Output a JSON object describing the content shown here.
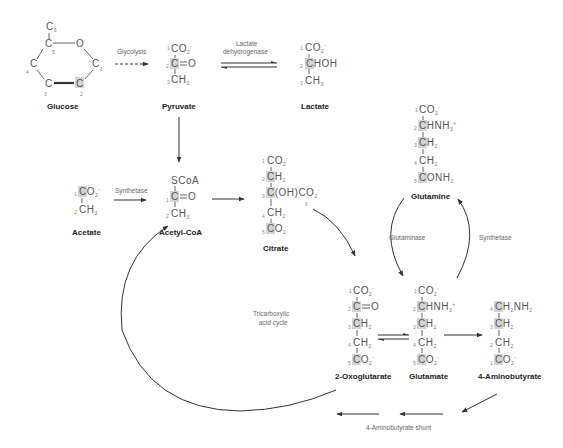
{
  "molecules": {
    "glucose": {
      "name": "Glucose",
      "atoms": [
        "C",
        "C",
        "O",
        "C",
        "C",
        "C",
        "C"
      ],
      "numbers": [
        "6",
        "5",
        "4",
        "1",
        "3",
        "2"
      ]
    },
    "pyruvate": {
      "name": "Pyruvate",
      "lines": [
        "CO2-",
        "C=O",
        "CH3"
      ],
      "numbers": [
        "1",
        "2",
        "3"
      ],
      "labeled_carbon": "2"
    },
    "lactate": {
      "name": "Lactate",
      "lines": [
        "CO2-",
        "CHOH",
        "CH3"
      ],
      "numbers": [
        "1",
        "2",
        "3"
      ],
      "labeled_carbon": "2"
    },
    "acetate": {
      "name": "Acetate",
      "lines": [
        "CO2-",
        "CH3"
      ],
      "numbers": [
        "1",
        "2"
      ],
      "labeled_carbon": "1"
    },
    "acetyl_coa": {
      "name": "Acetyl-CoA",
      "lines": [
        "SCoA",
        "C=O",
        "CH3"
      ],
      "numbers": [
        "1",
        "2"
      ],
      "labeled_carbon": "1"
    },
    "citrate": {
      "name": "Citrate",
      "lines": [
        "CO2-",
        "CH2",
        "C(OH)CO2-",
        "CH2",
        "CO2-"
      ],
      "numbers": [
        "1",
        "2",
        "3",
        "4",
        "5",
        "6"
      ],
      "labeled_carbons": [
        "2",
        "3",
        "5"
      ]
    },
    "oxoglutarate": {
      "name": "2-Oxoglutarate",
      "lines": [
        "CO2-",
        "C=O",
        "CH2",
        "CH2",
        "CO2-"
      ],
      "numbers": [
        "1",
        "2",
        "3",
        "4",
        "5"
      ],
      "labeled_carbons": [
        "2",
        "3",
        "5"
      ]
    },
    "glutamate": {
      "name": "Glutamate",
      "lines": [
        "CO2-",
        "CHNH3+",
        "CH2",
        "CH2",
        "CO2-"
      ],
      "numbers": [
        "1",
        "2",
        "3",
        "4",
        "5"
      ],
      "labeled_carbons": [
        "2",
        "3",
        "5"
      ]
    },
    "glutamine": {
      "name": "Glutamine",
      "lines": [
        "CO2-",
        "CHNH3+",
        "CH2",
        "CH2",
        "CONH2"
      ],
      "numbers": [
        "1",
        "2",
        "3",
        "4",
        "5"
      ],
      "labeled_carbons": [
        "2",
        "3",
        "5"
      ]
    },
    "aminobutyrate": {
      "name": "4-Aminobutyrate",
      "lines": [
        "CH2NH2",
        "CH2",
        "CH2",
        "CO2-"
      ],
      "numbers": [
        "4",
        "3",
        "2",
        "1"
      ],
      "labeled_carbons": [
        "4",
        "3",
        "1"
      ]
    }
  },
  "enzymes": {
    "glycolysis": "Glycolysis",
    "ldh_line1": "Lactate",
    "ldh_line2": "dehydrogenase",
    "acetate_synthetase": "Synthetase",
    "glutaminase": "Glutaminase",
    "glutamine_synthetase": "Synthetase",
    "tca_line1": "Tricarboxylic",
    "tca_line2": "acid cycle",
    "shunt": "4-Aminobutyrate shunt"
  },
  "colors": {
    "highlight": "#d4d4d4",
    "atom_text": "#555555",
    "arrow": "#333333"
  }
}
